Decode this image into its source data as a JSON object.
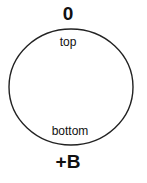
{
  "diagram": {
    "labels": {
      "top_pole": "0",
      "bottom_pole": "+B",
      "inner_top": "top",
      "inner_bottom": "bottom"
    },
    "shape": {
      "type": "ellipse",
      "stroke": "#222222",
      "fill": "#ffffff"
    }
  }
}
